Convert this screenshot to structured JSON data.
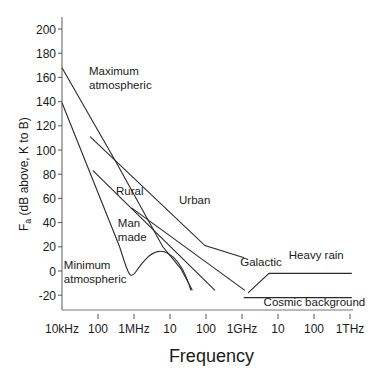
{
  "chart_data": {
    "type": "line",
    "title": "",
    "xlabel": "Frequency",
    "ylabel": "Fa (dB above kT0B)",
    "ylabel_display": "F",
    "ylabel_sub": "a",
    "ylabel_rest": " (dB above, K to B)",
    "x_scale": "log",
    "x_unit": "log10(Hz)",
    "xlim": [
      4,
      12
    ],
    "ylim": [
      -32,
      210
    ],
    "xticks": [
      {
        "value": 4,
        "label": "10kHz"
      },
      {
        "value": 5,
        "label": "100"
      },
      {
        "value": 6,
        "label": "1MHz"
      },
      {
        "value": 7,
        "label": "10"
      },
      {
        "value": 8,
        "label": "100"
      },
      {
        "value": 9,
        "label": "1GHz"
      },
      {
        "value": 10,
        "label": "10"
      },
      {
        "value": 11,
        "label": "100"
      },
      {
        "value": 12,
        "label": "1THz"
      }
    ],
    "yticks": [
      -20,
      0,
      20,
      40,
      60,
      80,
      100,
      120,
      140,
      160,
      180,
      200
    ],
    "grid": false,
    "series": [
      {
        "name": "Maximum atmospheric",
        "label_lines": [
          "Maximum",
          "atmospheric"
        ],
        "label_at": [
          4.75,
          162
        ],
        "points": [
          [
            4.0,
            168
          ],
          [
            5.5,
            90
          ],
          [
            6.8,
            20
          ],
          [
            7.3,
            2
          ],
          [
            7.55,
            -12
          ],
          [
            7.62,
            -16
          ]
        ]
      },
      {
        "name": "Minimum atmospheric",
        "label_lines": [
          "Minimum",
          "atmospheric"
        ],
        "label_at": [
          4.05,
          2
        ],
        "points": [
          [
            4.0,
            139
          ],
          [
            5.6,
            20
          ],
          [
            5.85,
            -3
          ],
          [
            5.98,
            -4
          ],
          [
            6.2,
            6
          ],
          [
            6.5,
            15
          ],
          [
            6.8,
            17
          ],
          [
            7.1,
            12
          ],
          [
            7.35,
            2
          ],
          [
            7.52,
            -10
          ],
          [
            7.58,
            -16
          ]
        ]
      },
      {
        "name": "Urban",
        "label_lines": [
          "Urban"
        ],
        "label_at": [
          7.25,
          55
        ],
        "points": [
          [
            4.78,
            111
          ],
          [
            7.97,
            21
          ],
          [
            9.06,
            11
          ]
        ]
      },
      {
        "name": "Rural",
        "label_lines": [
          "Rural"
        ],
        "label_at": [
          5.5,
          63
        ],
        "points": [
          [
            4.86,
            83
          ],
          [
            8.25,
            -16
          ]
        ]
      },
      {
        "name": "Man made",
        "label_lines": [
          "Man",
          "made"
        ],
        "label_at": [
          5.55,
          36
        ],
        "points": []
      },
      {
        "name": "Galactic",
        "label_lines": [
          "Galactic"
        ],
        "label_at": [
          8.95,
          4
        ],
        "points": [
          [
            5.94,
            52
          ],
          [
            9.08,
            -16
          ]
        ]
      },
      {
        "name": "Heavy rain",
        "label_lines": [
          "Heavy rain"
        ],
        "label_at": [
          10.3,
          10
        ],
        "points": [
          [
            9.17,
            -18
          ],
          [
            9.75,
            -2
          ],
          [
            12.05,
            -2
          ]
        ]
      },
      {
        "name": "Cosmic background",
        "label_lines": [
          "Cosmic background"
        ],
        "label_at": [
          9.6,
          -29
        ],
        "points": [
          [
            9.05,
            -22
          ],
          [
            12.05,
            -22
          ]
        ]
      }
    ]
  }
}
